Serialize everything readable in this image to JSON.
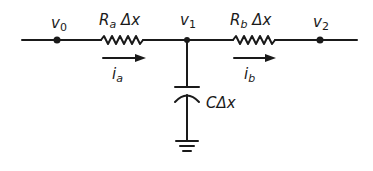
{
  "diagram": {
    "type": "circuit",
    "nodes": [
      {
        "id": "v0",
        "label": "v",
        "sub": "0"
      },
      {
        "id": "v1",
        "label": "v",
        "sub": "1"
      },
      {
        "id": "v2",
        "label": "v",
        "sub": "2"
      }
    ],
    "components": [
      {
        "id": "Ra",
        "type": "resistor",
        "label": "R",
        "sub": "a",
        "suffix": "Δx",
        "from": "v0",
        "to": "v1"
      },
      {
        "id": "Rb",
        "type": "resistor",
        "label": "R",
        "sub": "b",
        "suffix": "Δx",
        "from": "v1",
        "to": "v2"
      },
      {
        "id": "C",
        "type": "capacitor",
        "label": "CΔx",
        "from": "v1",
        "to": "ground"
      }
    ],
    "currents": [
      {
        "id": "ia",
        "label": "i",
        "sub": "a",
        "direction": "right",
        "through": "Ra"
      },
      {
        "id": "ib",
        "label": "i",
        "sub": "b",
        "direction": "right",
        "through": "Rb"
      }
    ],
    "colors": {
      "stroke": "#1a1a1a",
      "background": "#ffffff"
    }
  }
}
